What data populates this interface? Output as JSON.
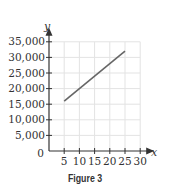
{
  "chart_data": {
    "type": "line",
    "title": "",
    "caption": "Figure 3",
    "xlabel": "x",
    "ylabel": "y",
    "xlim": [
      0,
      30
    ],
    "ylim": [
      0,
      35000
    ],
    "x_ticks": [
      5,
      10,
      15,
      20,
      25,
      30
    ],
    "x_tick_labels": [
      "5",
      "10",
      "15",
      "20",
      "25",
      "30"
    ],
    "y_ticks": [
      5000,
      10000,
      15000,
      20000,
      25000,
      30000,
      35000
    ],
    "y_tick_labels": [
      "5,000",
      "10,000",
      "15,000",
      "20,000",
      "25,000",
      "30,000",
      "35,000"
    ],
    "origin_label": "0",
    "grid": true,
    "legend": null,
    "series": [
      {
        "name": "line",
        "x": [
          5,
          25
        ],
        "y": [
          16000,
          32000
        ],
        "color": "#666666"
      }
    ]
  },
  "colors": {
    "axis": "#333333",
    "grid": "#e3e3e3",
    "line": "#666666"
  }
}
